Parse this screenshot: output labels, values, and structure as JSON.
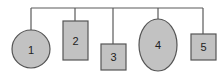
{
  "diagram": {
    "colors": {
      "fill": "#c2c2c2",
      "stroke": "#555555",
      "text": "#222222",
      "background": "#ffffff"
    },
    "nodes": [
      {
        "id": 1,
        "label": "1",
        "shape": "circle"
      },
      {
        "id": 2,
        "label": "2",
        "shape": "rectangle"
      },
      {
        "id": 3,
        "label": "3",
        "shape": "square"
      },
      {
        "id": 4,
        "label": "4",
        "shape": "ellipse"
      },
      {
        "id": 5,
        "label": "5",
        "shape": "square"
      }
    ]
  }
}
